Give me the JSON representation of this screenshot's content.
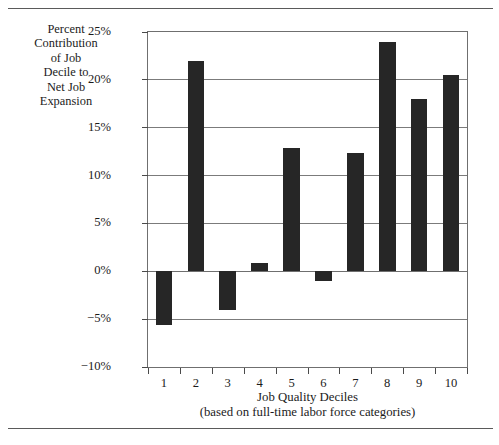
{
  "chart_data": {
    "type": "bar",
    "title": "",
    "subtitle": "",
    "xlabel": "Job Quality Deciles",
    "xlabel_note": "(based on full-time labor force categories)",
    "ylabel": "Percent Contribution of Job Decile to Net Job Expansion",
    "ylabel_lines": [
      "Percent",
      "Contribution",
      "of Job",
      "Decile to",
      "Net Job",
      "Expansion"
    ],
    "categories": [
      "1",
      "2",
      "3",
      "4",
      "5",
      "6",
      "7",
      "8",
      "9",
      "10"
    ],
    "values": [
      -5.6,
      22.0,
      -4.0,
      0.9,
      12.9,
      -1.0,
      12.4,
      24.0,
      18.0,
      20.5
    ],
    "ylim": [
      -10,
      25
    ],
    "ytick_values": [
      25,
      20,
      15,
      10,
      5,
      0,
      -5,
      -10
    ],
    "ytick_labels": [
      "25%",
      "20%",
      "15%",
      "10%",
      "5%",
      "0%",
      "−5%",
      "−10%"
    ],
    "grid": true,
    "grid_axis": "y",
    "legend": false,
    "legend_position": "none",
    "series": [
      {
        "name": "Percent Contribution",
        "values": [
          -5.6,
          22.0,
          -4.0,
          0.9,
          12.9,
          -1.0,
          12.4,
          24.0,
          18.0,
          20.5
        ]
      }
    ]
  },
  "colors": {
    "bar": "#262626",
    "axis": "#6f6f6f",
    "grid": "#7b7b7b",
    "text": "#1b1b1b",
    "rule": "#5a5a5a",
    "background": "#ffffff"
  }
}
